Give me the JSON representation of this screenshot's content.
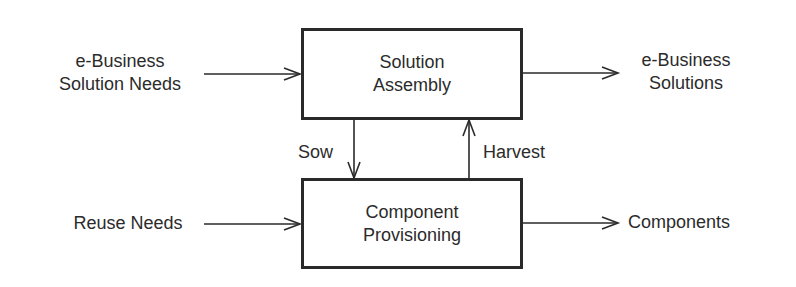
{
  "diagram": {
    "boxes": {
      "solution_assembly": {
        "line1": "Solution",
        "line2": "Assembly"
      },
      "component_provisioning": {
        "line1": "Component",
        "line2": "Provisioning"
      }
    },
    "inputs": {
      "solution_needs": {
        "line1": "e-Business",
        "line2": "Solution Needs"
      },
      "reuse_needs": {
        "line1": "Reuse Needs"
      }
    },
    "outputs": {
      "solutions": {
        "line1": "e-Business",
        "line2": "Solutions"
      },
      "components": {
        "line1": "Components"
      }
    },
    "flows": {
      "sow": "Sow",
      "harvest": "Harvest"
    },
    "edges": [
      {
        "from": "e-Business Solution Needs",
        "to": "Solution Assembly"
      },
      {
        "from": "Solution Assembly",
        "to": "e-Business Solutions"
      },
      {
        "from": "Solution Assembly",
        "to": "Component Provisioning",
        "label": "Sow"
      },
      {
        "from": "Component Provisioning",
        "to": "Solution Assembly",
        "label": "Harvest"
      },
      {
        "from": "Reuse Needs",
        "to": "Component Provisioning"
      },
      {
        "from": "Component Provisioning",
        "to": "Components"
      }
    ],
    "colors": {
      "stroke": "#2a2a2a",
      "text": "#2b2b2b",
      "background": "#ffffff"
    }
  }
}
